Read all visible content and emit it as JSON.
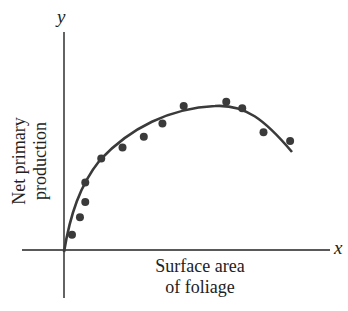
{
  "chart_data": {
    "type": "scatter",
    "title": "",
    "xlabel": "Surface area of foliage",
    "ylabel": "Net primary production",
    "x_axis_var": "x",
    "y_axis_var": "y",
    "xlabel_lines": [
      "Surface area",
      "of foliage"
    ],
    "ylabel_lines": [
      "Net primary",
      "production"
    ],
    "grid": false,
    "ticks": "none",
    "xlim": [
      0,
      100
    ],
    "ylim": [
      0,
      100
    ],
    "series": [
      {
        "name": "observations",
        "kind": "points",
        "x": [
          3,
          6,
          8,
          8,
          14,
          22,
          30,
          37,
          45,
          61,
          67,
          75,
          85
        ],
        "y": [
          7,
          15,
          22,
          31,
          42,
          47,
          52,
          58,
          66,
          68,
          65,
          54,
          50
        ]
      },
      {
        "name": "fitted curve",
        "kind": "line",
        "x": [
          0,
          5,
          10,
          20,
          30,
          40,
          50,
          60,
          70,
          80,
          86
        ],
        "y": [
          0,
          20,
          33,
          47,
          56,
          62,
          65,
          65,
          60,
          50,
          42
        ]
      }
    ]
  },
  "labels": {
    "x_var": "x",
    "y_var": "y",
    "xlabel_line1": "Surface area",
    "xlabel_line2": "of foliage",
    "ylabel_line1": "Net primary",
    "ylabel_line2": "production"
  },
  "colors": {
    "ink": "#222222",
    "points": "#3a3a3a",
    "curve": "#3a3a3a"
  }
}
